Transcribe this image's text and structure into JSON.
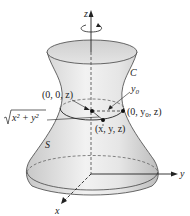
{
  "diagram": {
    "type": "surface-of-revolution",
    "axes": {
      "z_label": "z",
      "y_label": "y",
      "x_label": "x"
    },
    "labels": {
      "curve": "C",
      "surface": "S",
      "y0": "y",
      "y0_sub": "0",
      "point_axis": "(0, 0, z)",
      "point_curve_prefix": "(0, y",
      "point_curve_sub": "0",
      "point_curve_suffix": ", z)",
      "point_general": "(x, y, z)",
      "radius": "x² + y²"
    },
    "colors": {
      "surface_fill": "#d9d9d9",
      "surface_light": "#f0f0f0",
      "stroke": "#333333",
      "background": "#ffffff"
    }
  }
}
